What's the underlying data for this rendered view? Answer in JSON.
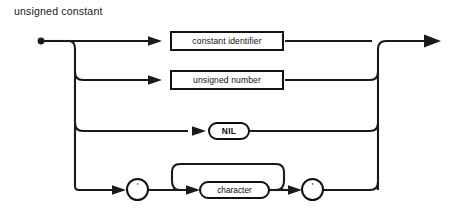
{
  "diagram": {
    "title": "unsigned constant",
    "type": "railroad-syntax-diagram",
    "ink_color": "#1a1a1a",
    "background_color": "#ffffff",
    "start_marker": "start-dot",
    "end_marker": "arrow-right",
    "alternatives": [
      {
        "id": "alt-constant-identifier",
        "kind": "nonterminal",
        "shape": "rectangle",
        "label": "constant identifier"
      },
      {
        "id": "alt-unsigned-number",
        "kind": "nonterminal",
        "shape": "rectangle",
        "label": "unsigned number"
      },
      {
        "id": "alt-nil",
        "kind": "terminal",
        "shape": "oval",
        "label": "NIL"
      },
      {
        "id": "alt-character-string",
        "kind": "sequence",
        "label": "quoted character string",
        "open_quote": "'",
        "close_quote": "'",
        "repeat_label": "character",
        "repeat_shape": "stadium",
        "has_loop_back": true
      }
    ]
  }
}
